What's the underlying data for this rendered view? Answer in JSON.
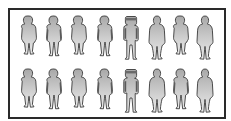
{
  "diagram": {
    "title": "",
    "layout": {
      "rows": 2,
      "columns": 8
    },
    "colors": {
      "frame": "#2a2a2a",
      "background": "#ffffff",
      "figure_fill_light": "#e2e2e2",
      "figure_fill_dark": "#9a9a9a",
      "figure_outline": "#3a3a3a",
      "arm_shade": "#5a5a5a"
    },
    "rows": [
      {
        "figures": [
          {
            "type": "standard"
          },
          {
            "type": "shaded-arms"
          },
          {
            "type": "standard"
          },
          {
            "type": "shaded-arms"
          },
          {
            "type": "thin-boxy-head"
          },
          {
            "type": "rounded"
          },
          {
            "type": "standard"
          },
          {
            "type": "rounded"
          }
        ]
      },
      {
        "figures": [
          {
            "type": "standard"
          },
          {
            "type": "shaded-arms"
          },
          {
            "type": "standard"
          },
          {
            "type": "shaded-arms"
          },
          {
            "type": "thin-boxy-head"
          },
          {
            "type": "rounded"
          },
          {
            "type": "shaded-arms"
          },
          {
            "type": "rounded"
          }
        ]
      }
    ]
  }
}
